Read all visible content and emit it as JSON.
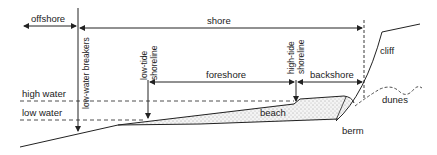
{
  "diagram": {
    "type": "beach profile cross-section",
    "zones": {
      "offshore": "offshore",
      "shore": "shore",
      "foreshore": "foreshore",
      "backshore": "backshore"
    },
    "vertical_markers": {
      "low_water_breakers": "low-water breakers",
      "low_tide_line1": "low-tide",
      "low_tide_line2": "shoreline",
      "high_tide_line1": "high-tide",
      "high_tide_line2": "shoreline"
    },
    "levels": {
      "high_water": "high water",
      "low_water": "low water"
    },
    "features": {
      "cliff": "cliff",
      "dunes": "dunes",
      "beach": "beach",
      "berm": "berm"
    },
    "colors": {
      "line": "#222222",
      "sand_fill": "#eeeeee",
      "background": "#ffffff"
    }
  }
}
